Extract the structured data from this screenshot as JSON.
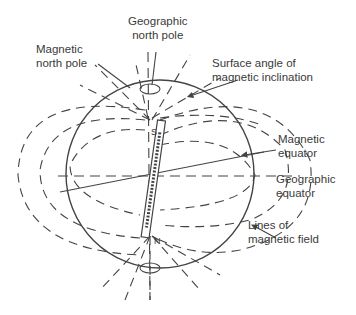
{
  "labels": {
    "geo_north_pole": [
      "Geographic",
      "north pole"
    ],
    "mag_north_pole": [
      "Magnetic",
      "north pole"
    ],
    "surface_angle": [
      "Surface angle of",
      "magnetic inclination"
    ],
    "mag_equator": [
      "Magnetic",
      "equator"
    ],
    "geo_equator": [
      "Geographic",
      "equator"
    ],
    "field_lines": [
      "Lines of",
      "magnetic field"
    ]
  },
  "magnet": {
    "top_pole": "S",
    "bottom_pole": "N"
  },
  "colors": {
    "line": "#444444",
    "text": "#3a3a3a",
    "background": "#ffffff"
  }
}
